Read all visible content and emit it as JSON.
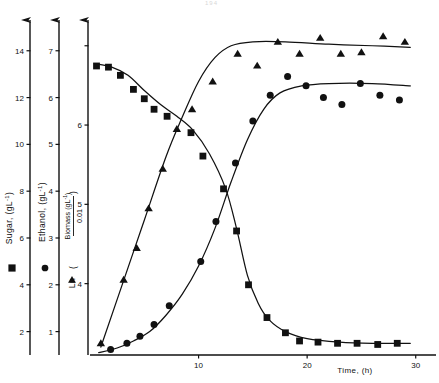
{
  "figure": {
    "page_artifact": "194",
    "background": "#ffffff",
    "ink": "#111111"
  },
  "xaxis": {
    "label": "Time, (h)",
    "ticks": [
      10,
      20,
      30
    ],
    "range": [
      0,
      31.5
    ],
    "pixel_origin_x": 90,
    "pixel_per_unit": 10.45
  },
  "axes": [
    {
      "id": "sugar",
      "label": "Sugar, (gL",
      "label_sup": "-1",
      "label_tail": ")",
      "marker": "square",
      "marker_glyph": "■",
      "ticks": [
        2,
        4,
        6,
        8,
        10,
        12,
        14
      ],
      "range": [
        1.0,
        15.4
      ],
      "axis_x": 30
    },
    {
      "id": "ethanol",
      "label": "Ethanol, (gL",
      "label_sup": "-1",
      "label_tail": ")",
      "marker": "circle",
      "marker_glyph": "●",
      "ticks": [
        1,
        2,
        3,
        4,
        5,
        6,
        7
      ],
      "range": [
        0.5,
        7.7
      ],
      "axis_x": 59
    },
    {
      "id": "biomass",
      "label_prefix": "Ln",
      "label_numerator": "Biomass (gL",
      "label_numerator_sup": "-1",
      "label_numerator_tail": ")",
      "label_denominator": "0.01",
      "marker": "triangle",
      "marker_glyph": "▲",
      "ticks": [
        4,
        5,
        6
      ],
      "range": [
        3.1,
        7.35
      ],
      "axis_x": 88
    }
  ],
  "chart_data": {
    "type": "scatter",
    "title": "",
    "xlabel": "Time, (h)",
    "grid": false,
    "legend": "axis-labels",
    "xlim": [
      0,
      31.5
    ],
    "series": [
      {
        "name": "Sugar, (gL-1)",
        "marker": "square",
        "axis": "sugar",
        "ylabel": "Sugar, (gL-1)",
        "ylim": [
          1.0,
          15.4
        ],
        "points": [
          [
            0.6,
            13.35
          ],
          [
            1.7,
            13.3
          ],
          [
            2.8,
            12.95
          ],
          [
            4.0,
            12.35
          ],
          [
            5.0,
            11.95
          ],
          [
            5.9,
            11.5
          ],
          [
            7.1,
            11.2
          ],
          [
            9.3,
            10.5
          ],
          [
            10.4,
            9.5
          ],
          [
            12.3,
            8.1
          ],
          [
            13.5,
            6.3
          ],
          [
            14.6,
            4.0
          ],
          [
            16.3,
            2.6
          ],
          [
            18.0,
            1.95
          ],
          [
            19.3,
            1.6
          ],
          [
            21.0,
            1.55
          ],
          [
            22.8,
            1.5
          ],
          [
            24.6,
            1.5
          ],
          [
            26.5,
            1.45
          ],
          [
            28.3,
            1.5
          ]
        ]
      },
      {
        "name": "Ethanol, (gL-1)",
        "marker": "circle",
        "axis": "ethanol",
        "ylabel": "Ethanol, (gL-1)",
        "ylim": [
          0.5,
          7.7
        ],
        "points": [
          [
            1.9,
            0.62
          ],
          [
            3.4,
            0.75
          ],
          [
            4.6,
            0.9
          ],
          [
            5.9,
            1.15
          ],
          [
            7.3,
            1.55
          ],
          [
            10.2,
            2.5
          ],
          [
            11.6,
            3.35
          ],
          [
            13.4,
            4.6
          ],
          [
            15.0,
            5.5
          ],
          [
            16.6,
            6.05
          ],
          [
            18.2,
            6.45
          ],
          [
            19.9,
            6.25
          ],
          [
            21.5,
            6.0
          ],
          [
            23.2,
            5.85
          ],
          [
            24.9,
            6.3
          ],
          [
            26.7,
            6.05
          ],
          [
            28.5,
            5.95
          ]
        ]
      },
      {
        "name": "Ln (Biomass (gL-1) / 0.01)",
        "marker": "triangle",
        "axis": "biomass",
        "ylabel": "Ln (Biomass (gL-1)/0.01)",
        "ylim": [
          3.1,
          7.35
        ],
        "points": [
          [
            1.0,
            3.25
          ],
          [
            3.1,
            4.05
          ],
          [
            4.3,
            4.45
          ],
          [
            5.4,
            4.95
          ],
          [
            6.7,
            5.45
          ],
          [
            8.0,
            5.95
          ],
          [
            9.4,
            6.2
          ],
          [
            11.3,
            6.55
          ],
          [
            13.6,
            6.9
          ],
          [
            15.4,
            6.75
          ],
          [
            17.3,
            7.05
          ],
          [
            19.3,
            6.9
          ],
          [
            21.2,
            7.1
          ],
          [
            23.1,
            6.9
          ],
          [
            25.0,
            6.92
          ],
          [
            27.0,
            7.12
          ],
          [
            29.0,
            7.05
          ]
        ]
      }
    ],
    "fitted_curves": [
      {
        "name": "sugar-curve",
        "axis": "sugar",
        "points": [
          [
            0.4,
            13.45
          ],
          [
            2.0,
            13.3
          ],
          [
            3.5,
            12.95
          ],
          [
            5.0,
            12.3
          ],
          [
            6.5,
            11.7
          ],
          [
            8.0,
            11.2
          ],
          [
            9.5,
            10.6
          ],
          [
            11.0,
            9.6
          ],
          [
            12.5,
            8.1
          ],
          [
            13.5,
            6.4
          ],
          [
            14.5,
            4.4
          ],
          [
            15.5,
            3.2
          ],
          [
            16.5,
            2.5
          ],
          [
            18.0,
            2.0
          ],
          [
            20.0,
            1.7
          ],
          [
            23.0,
            1.55
          ],
          [
            26.0,
            1.5
          ],
          [
            29.5,
            1.5
          ]
        ]
      },
      {
        "name": "ethanol-curve",
        "axis": "ethanol",
        "points": [
          [
            0.8,
            0.55
          ],
          [
            2.5,
            0.65
          ],
          [
            4.0,
            0.8
          ],
          [
            5.5,
            1.0
          ],
          [
            7.0,
            1.35
          ],
          [
            8.5,
            1.8
          ],
          [
            10.0,
            2.4
          ],
          [
            11.5,
            3.2
          ],
          [
            13.0,
            4.2
          ],
          [
            14.5,
            5.1
          ],
          [
            16.0,
            5.75
          ],
          [
            17.5,
            6.1
          ],
          [
            19.5,
            6.25
          ],
          [
            22.0,
            6.3
          ],
          [
            26.0,
            6.3
          ],
          [
            29.5,
            6.25
          ]
        ]
      },
      {
        "name": "biomass-curve",
        "axis": "biomass",
        "points": [
          [
            1.0,
            3.2
          ],
          [
            3.0,
            4.0
          ],
          [
            5.0,
            4.8
          ],
          [
            7.0,
            5.6
          ],
          [
            8.5,
            6.1
          ],
          [
            10.0,
            6.55
          ],
          [
            11.5,
            6.85
          ],
          [
            13.0,
            7.0
          ],
          [
            15.0,
            7.05
          ],
          [
            18.0,
            7.05
          ],
          [
            22.0,
            7.02
          ],
          [
            26.0,
            7.0
          ],
          [
            29.5,
            6.98
          ]
        ]
      }
    ]
  }
}
